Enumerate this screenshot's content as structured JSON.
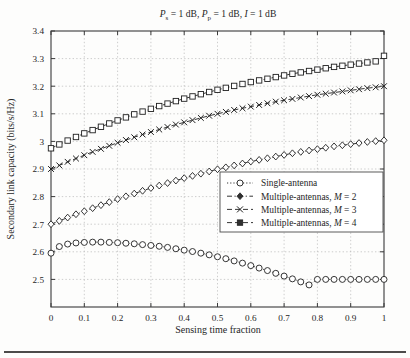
{
  "figure": {
    "title": "Ps = 1 dB, Pp = 1 dB, I = 1 dB",
    "title_parts": {
      "p1_sym": "P",
      "p1_sub": "s",
      "p1_val": " = 1 dB, ",
      "p2_sym": "P",
      "p2_sub": "p",
      "p2_val": " = 1 dB, ",
      "p3_sym": "I",
      "p3_val": " = 1 dB"
    },
    "background": "#fdfdfc",
    "axis_color": "#3a3a3a",
    "grid_color": "#b9b9b9"
  },
  "chart_data": {
    "type": "line",
    "title": "Ps = 1 dB, Pp = 1 dB, I = 1 dB",
    "xlabel": "Sensing time fraction",
    "ylabel": "Secondary link capacity (bits/s/Hz)",
    "xlim": [
      0,
      1
    ],
    "ylim": [
      2.4,
      3.4
    ],
    "grid": true,
    "legend_position": "center-right",
    "xticks": [
      0,
      0.1,
      0.2,
      0.3,
      0.4,
      0.5,
      0.6,
      0.7,
      0.8,
      0.9,
      1
    ],
    "xtick_labels": [
      "0",
      "0.1",
      "0.2",
      "0.3",
      "0.4",
      "0.5",
      "0.6",
      "0.7",
      "0.8",
      "0.9",
      "1"
    ],
    "yticks": [
      2.5,
      2.6,
      2.7,
      2.8,
      2.9,
      3.0,
      3.1,
      3.2,
      3.3,
      3.4
    ],
    "ytick_labels": [
      "2.5",
      "2.6",
      "2.7",
      "2.8",
      "2.9",
      "3",
      "3.1",
      "3.2",
      "3.3",
      "3.4"
    ],
    "x": [
      0,
      0.025,
      0.05,
      0.075,
      0.1,
      0.125,
      0.15,
      0.175,
      0.2,
      0.225,
      0.25,
      0.275,
      0.3,
      0.325,
      0.35,
      0.375,
      0.4,
      0.425,
      0.45,
      0.475,
      0.5,
      0.525,
      0.55,
      0.575,
      0.6,
      0.625,
      0.65,
      0.675,
      0.7,
      0.725,
      0.75,
      0.775,
      0.8,
      0.825,
      0.85,
      0.875,
      0.9,
      0.925,
      0.95,
      0.975,
      1
    ],
    "series": [
      {
        "name": "Single-antenna",
        "marker": "circle",
        "linestyle": "dotted",
        "values": [
          2.595,
          2.619,
          2.628,
          2.632,
          2.634,
          2.635,
          2.635,
          2.634,
          2.633,
          2.631,
          2.629,
          2.626,
          2.623,
          2.62,
          2.616,
          2.611,
          2.606,
          2.601,
          2.595,
          2.589,
          2.582,
          2.575,
          2.567,
          2.559,
          2.55,
          2.541,
          2.532,
          2.522,
          2.512,
          2.502,
          2.491,
          2.48,
          2.5,
          2.5,
          2.5,
          2.5,
          2.5,
          2.5,
          2.5,
          2.5,
          2.5
        ]
      },
      {
        "name": "Multiple-antennas, M = 2",
        "marker": "diamond",
        "linestyle": "dashdot",
        "values": [
          2.7,
          2.712,
          2.724,
          2.736,
          2.747,
          2.758,
          2.769,
          2.78,
          2.791,
          2.801,
          2.811,
          2.821,
          2.831,
          2.84,
          2.849,
          2.858,
          2.867,
          2.875,
          2.883,
          2.891,
          2.899,
          2.906,
          2.913,
          2.92,
          2.927,
          2.933,
          2.939,
          2.945,
          2.951,
          2.957,
          2.962,
          2.967,
          2.972,
          2.977,
          2.982,
          2.986,
          2.99,
          2.994,
          2.998,
          3.001,
          3.004
        ]
      },
      {
        "name": "Multiple-antennas, M = 3",
        "marker": "x",
        "linestyle": "dashed",
        "values": [
          2.9,
          2.913,
          2.926,
          2.938,
          2.95,
          2.962,
          2.973,
          2.984,
          2.995,
          3.005,
          3.015,
          3.025,
          3.034,
          3.043,
          3.052,
          3.061,
          3.069,
          3.077,
          3.085,
          3.093,
          3.1,
          3.107,
          3.114,
          3.12,
          3.126,
          3.132,
          3.138,
          3.144,
          3.149,
          3.154,
          3.159,
          3.164,
          3.169,
          3.173,
          3.177,
          3.181,
          3.185,
          3.189,
          3.193,
          3.196,
          3.2
        ]
      },
      {
        "name": "Multiple-antennas, M = 4",
        "marker": "square",
        "linestyle": "dashed",
        "values": [
          2.975,
          2.989,
          3.003,
          3.016,
          3.029,
          3.041,
          3.053,
          3.065,
          3.076,
          3.087,
          3.098,
          3.108,
          3.118,
          3.128,
          3.137,
          3.146,
          3.155,
          3.163,
          3.171,
          3.179,
          3.187,
          3.194,
          3.201,
          3.208,
          3.215,
          3.221,
          3.227,
          3.233,
          3.239,
          3.245,
          3.25,
          3.255,
          3.26,
          3.265,
          3.27,
          3.274,
          3.278,
          3.282,
          3.286,
          3.29,
          3.31
        ]
      }
    ]
  },
  "legend": {
    "items": [
      {
        "label": "Single-antenna",
        "marker": "circle",
        "linestyle": "dotted"
      },
      {
        "label": "Multiple-antennas, M = 2",
        "marker": "diamond",
        "linestyle": "dashdot"
      },
      {
        "label": "Multiple-antennas, M = 3",
        "marker": "x",
        "linestyle": "dashed"
      },
      {
        "label": "Multiple-antennas, M = 4",
        "marker": "square",
        "linestyle": "dashed"
      }
    ],
    "entry_parts": [
      {
        "text": "Single-antenna",
        "sym": "",
        "tail": ""
      },
      {
        "text": "Multiple-antennas, ",
        "sym": "M",
        "tail": " = 2"
      },
      {
        "text": "Multiple-antennas, ",
        "sym": "M",
        "tail": " = 3"
      },
      {
        "text": "Multiple-antennas, ",
        "sym": "M",
        "tail": " = 4"
      }
    ]
  }
}
